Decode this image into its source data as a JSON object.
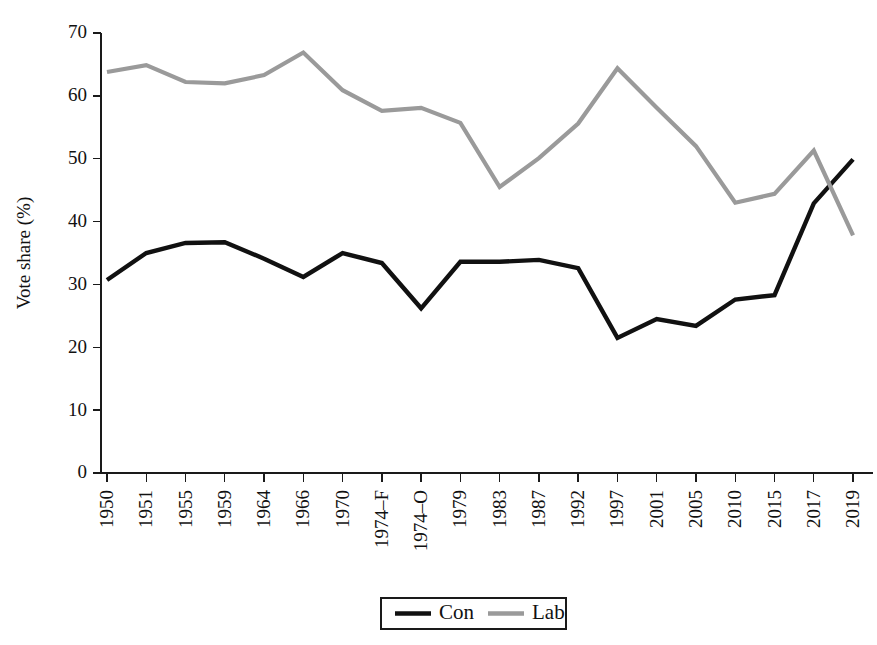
{
  "chart_data": {
    "type": "line",
    "title": "",
    "xlabel": "",
    "ylabel": "Vote share (%)",
    "ylim": [
      0,
      70
    ],
    "yticks": [
      0,
      10,
      20,
      30,
      40,
      50,
      60,
      70
    ],
    "grid": false,
    "legend_position": "bottom-center",
    "categories": [
      "1950",
      "1951",
      "1955",
      "1959",
      "1964",
      "1966",
      "1970",
      "1974–F",
      "1974–O",
      "1979",
      "1983",
      "1987",
      "1992",
      "1997",
      "2001",
      "2005",
      "2010",
      "2015",
      "2017",
      "2019"
    ],
    "series": [
      {
        "name": "Con",
        "color": "#111111",
        "values": [
          30.7,
          35.0,
          36.6,
          36.7,
          34.1,
          31.2,
          35.0,
          33.4,
          26.2,
          33.6,
          33.6,
          33.9,
          32.6,
          21.5,
          24.5,
          23.4,
          27.6,
          28.3,
          42.9,
          49.9
        ]
      },
      {
        "name": "Lab",
        "color": "#9a9a9a",
        "values": [
          63.8,
          64.9,
          62.2,
          62.0,
          63.3,
          66.9,
          60.9,
          57.6,
          58.1,
          55.7,
          45.5,
          50.1,
          55.6,
          64.4,
          58.1,
          52.0,
          43.0,
          44.4,
          51.3,
          37.8
        ]
      }
    ]
  },
  "legend": {
    "entries": [
      {
        "label": "Con",
        "color": "#111111",
        "width": 4.6
      },
      {
        "label": "Lab",
        "color": "#9a9a9a",
        "width": 4.6
      }
    ]
  }
}
